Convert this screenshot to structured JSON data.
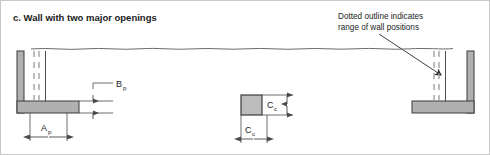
{
  "figure": {
    "title": "c. Wall with two major openings",
    "annotation": {
      "line1": "Dotted outline indicates",
      "line2": "range of wall positions"
    }
  },
  "colors": {
    "background": "#ffffff",
    "wall_fill": "#b0b0b0",
    "wall_fill_light": "#bdbdbd",
    "outline": "#3a3a3a",
    "dashed_line": "#9a9a9a",
    "dimension_line": "#4a4a4a",
    "text": "#1a1a1a",
    "frame_border": "#c8c8c8"
  },
  "dimensions": [
    {
      "id": "bp",
      "symbol": "B",
      "subscript": "p",
      "orientation": "vertical",
      "element": "left-wall-footing-thickness"
    },
    {
      "id": "ap",
      "symbol": "A",
      "subscript": "p",
      "orientation": "horizontal",
      "element": "left-wall-pier-width"
    },
    {
      "id": "cc-vertical",
      "symbol": "C",
      "subscript": "c",
      "orientation": "vertical",
      "element": "center-column-height"
    },
    {
      "id": "cc-horizontal",
      "symbol": "C",
      "subscript": "c",
      "orientation": "horizontal",
      "element": "center-column-width"
    }
  ],
  "elements": [
    {
      "id": "left-wall",
      "label": "Left wall with opening",
      "shape": "L-shaped-section"
    },
    {
      "id": "center-column",
      "label": "Center column",
      "shape": "square-section"
    },
    {
      "id": "right-wall",
      "label": "Right wall with opening",
      "shape": "mirrored-L-shaped-section"
    },
    {
      "id": "break-line",
      "label": "Wavy break line",
      "shape": "wavy-line"
    },
    {
      "id": "dotted-outline-left",
      "label": "Dotted wall position range (left)",
      "shape": "dashed-vertical-pair"
    },
    {
      "id": "dotted-outline-right",
      "label": "Dotted wall position range (right)",
      "shape": "dashed-vertical-pair"
    }
  ]
}
